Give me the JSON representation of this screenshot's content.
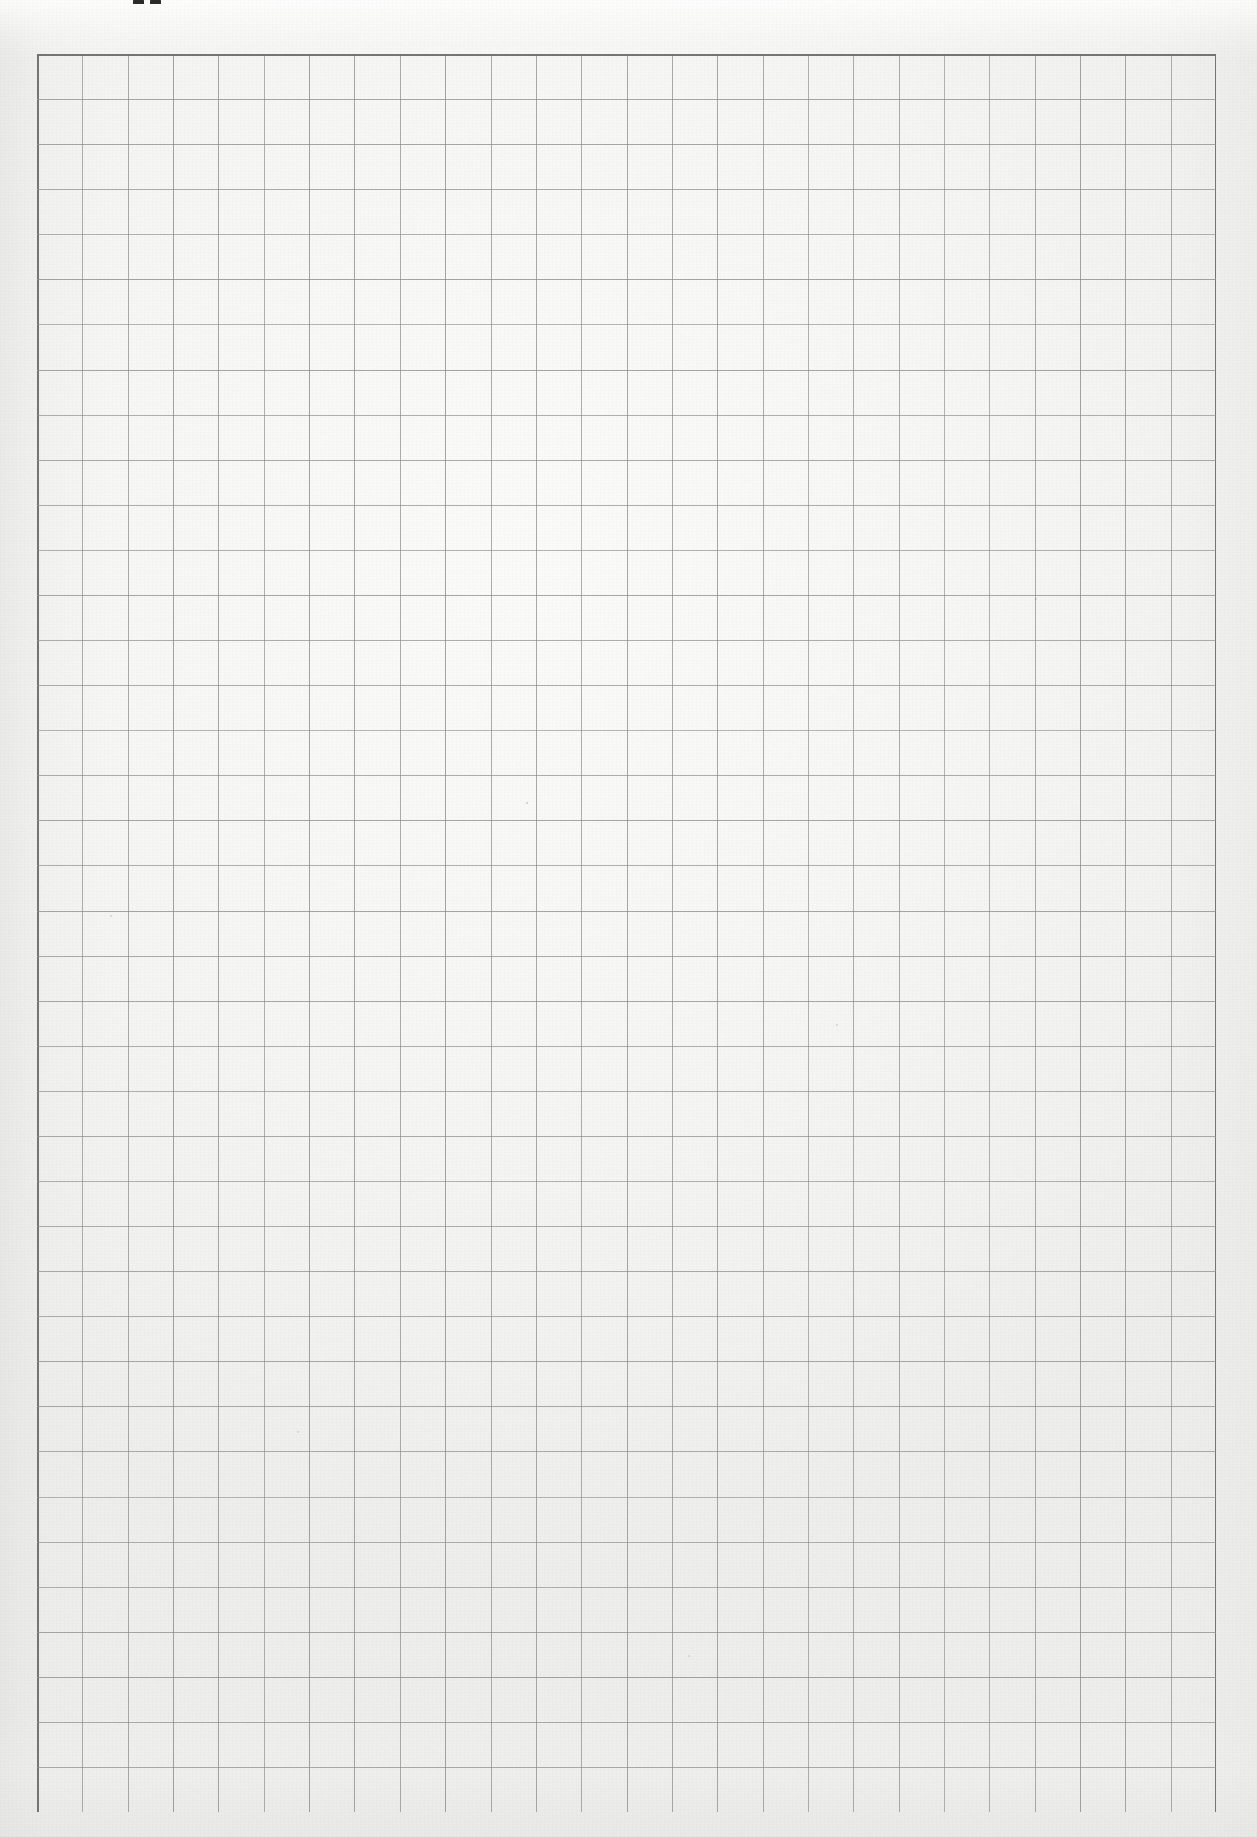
{
  "document": {
    "kind": "scanned-grid-paper",
    "title": "Squared exercise-book page",
    "page_width_px": 1257,
    "page_height_px": 1837,
    "paper_color": "#f7f7f5",
    "paper_color_light": "#fbfbfa",
    "paper_color_dark": "#eeeeec"
  },
  "grid": {
    "left_px": 37,
    "top_px": 54,
    "right_px": 1216,
    "bottom_px": 1812,
    "width_px": 1179,
    "height_px": 1758,
    "columns": 26,
    "rows": 39,
    "cell_width_px": 45.35,
    "cell_height_px": 45.08,
    "line_color": "#8d8d8d",
    "line_color_border": "#6f6f6f",
    "line_width_px": 1.1,
    "border_width_px": 1.8,
    "style": "uniform squares, no major/minor distinction"
  },
  "marks": {
    "description": "Two small dark ink marks clipped by the top edge of the scan",
    "items": [
      {
        "name": "top-ink-mark-left",
        "x_px": 133,
        "y_px": 0,
        "width_px": 11,
        "height_px": 4,
        "color": "#2a2a2a"
      },
      {
        "name": "top-ink-mark-right",
        "x_px": 150,
        "y_px": 0,
        "width_px": 11,
        "height_px": 4,
        "color": "#2a2a2a"
      }
    ]
  },
  "specks": {
    "description": "Faint scanner dust specks on the paper",
    "items": [
      {
        "x_px": 526,
        "y_px": 802,
        "size_px": 2,
        "opacity": 0.3
      },
      {
        "x_px": 110,
        "y_px": 915,
        "size_px": 2,
        "opacity": 0.22
      },
      {
        "x_px": 836,
        "y_px": 1024,
        "size_px": 2,
        "opacity": 0.2
      },
      {
        "x_px": 297,
        "y_px": 1431,
        "size_px": 2,
        "opacity": 0.18
      },
      {
        "x_px": 1035,
        "y_px": 598,
        "size_px": 2,
        "opacity": 0.2
      },
      {
        "x_px": 688,
        "y_px": 1655,
        "size_px": 2,
        "opacity": 0.18
      }
    ]
  }
}
